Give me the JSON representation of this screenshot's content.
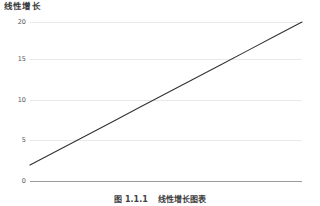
{
  "chart_data": {
    "type": "line",
    "title": "线性增长",
    "xlabel": "",
    "ylabel": "",
    "grid": true,
    "legend": false,
    "xlim": [
      0,
      10
    ],
    "ylim": [
      0,
      20
    ],
    "yticks": [
      0,
      5,
      10,
      15,
      20
    ],
    "ytick_labels": [
      "0",
      "5",
      "10",
      "15",
      "20"
    ],
    "xticks": [],
    "xtick_labels": [],
    "series": [
      {
        "name": "线性增长",
        "color": "#333333",
        "x": [
          0,
          1,
          2,
          3,
          4,
          5,
          6,
          7,
          8,
          9,
          10
        ],
        "values": [
          2,
          3.8,
          5.6,
          7.4,
          9.2,
          11,
          12.8,
          14.6,
          16.4,
          18.2,
          20
        ]
      }
    ]
  },
  "caption": {
    "number": "图 1.1.1",
    "text": "线性增长图表"
  }
}
